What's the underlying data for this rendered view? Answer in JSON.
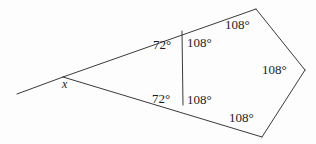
{
  "figure": {
    "name": "exterior-angle-pentagon-diagram",
    "width": 316,
    "height": 144,
    "background_color": "#fdfdfd",
    "stroke_color": "#3a3a3a",
    "text_color": "#1c1c1c"
  },
  "labels": {
    "unknown_angle": "x",
    "interior_top_left": "72°",
    "interior_bottom_left": "72°",
    "pentagon_top_left": "108°",
    "pentagon_bottom_left": "108°",
    "pentagon_top": "108°",
    "pentagon_right": "108°",
    "pentagon_bottom": "108°"
  },
  "geometry": {
    "ray_start": [
      17,
      94
    ],
    "apex": [
      63,
      77
    ],
    "upper_arm_end": [
      256,
      9
    ],
    "lower_arm_end": [
      262,
      137
    ],
    "chord_top": [
      182,
      31
    ],
    "chord_bottom": [
      183,
      105
    ],
    "pentagon_top_vertex": [
      256,
      9
    ],
    "pentagon_right_vertex": [
      305,
      70
    ],
    "pentagon_bottom_vertex": [
      262,
      137
    ]
  },
  "label_positions": {
    "unknown_angle": [
      62,
      78
    ],
    "interior_top_left": [
      153,
      38
    ],
    "pentagon_top_left": [
      187,
      36
    ],
    "interior_bottom_left": [
      152,
      92
    ],
    "pentagon_bottom_left": [
      187,
      93
    ],
    "pentagon_top": [
      225,
      18
    ],
    "pentagon_right": [
      262,
      63
    ],
    "pentagon_bottom": [
      229,
      111
    ]
  }
}
